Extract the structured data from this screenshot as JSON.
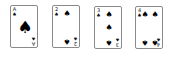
{
  "cards": [
    {
      "rank": "A",
      "suit": "♠",
      "suit_name": "spades"
    },
    {
      "rank": "2",
      "suit": "♠",
      "suit_name": "spades"
    },
    {
      "rank": "3",
      "suit": "♠",
      "suit_name": "spades"
    },
    {
      "rank": "4",
      "suit": "♠",
      "suit_name": "spades"
    }
  ],
  "colors": {
    "card_bg": "#ffffff",
    "card_border": "#8a8a8a",
    "suit": "#000000"
  }
}
